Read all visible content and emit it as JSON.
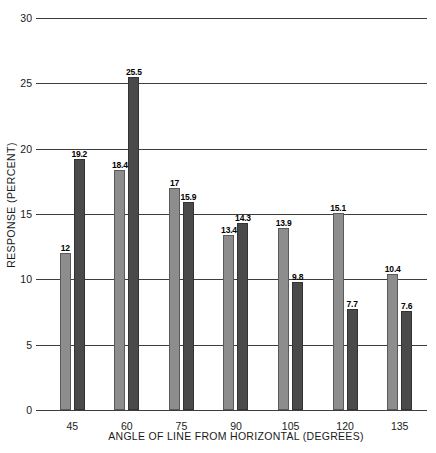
{
  "chart_data": {
    "type": "bar",
    "title": "",
    "xlabel": "ANGLE OF LINE FROM HORIZONTAL (DEGREES)",
    "ylabel": "RESPONSE (PERCENT)",
    "categories": [
      "45",
      "60",
      "75",
      "90",
      "105",
      "120",
      "135"
    ],
    "ylim": [
      0,
      30
    ],
    "yticks": [
      "0",
      "5",
      "10",
      "15",
      "20",
      "25",
      "30"
    ],
    "ytick_values": [
      0,
      5,
      10,
      15,
      20,
      25,
      30
    ],
    "grid": true,
    "legend": "none",
    "series": [
      {
        "name": "series-light",
        "color": "#8d8d8d",
        "values": [
          12,
          18.4,
          17,
          13.4,
          13.9,
          15.1,
          10.4
        ],
        "labels": [
          "12",
          "18.4",
          "17",
          "13.4",
          "13.9",
          "15.1",
          "10.4"
        ]
      },
      {
        "name": "series-dark",
        "color": "#4a4a4a",
        "values": [
          19.2,
          25.5,
          15.9,
          14.3,
          9.8,
          7.7,
          7.6
        ],
        "labels": [
          "19.2",
          "25.5",
          "15.9",
          "14.3",
          "9.8",
          "7.7",
          "7.6"
        ]
      }
    ]
  }
}
